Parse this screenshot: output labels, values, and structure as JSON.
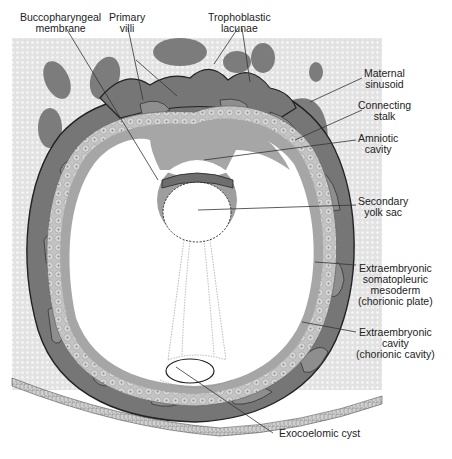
{
  "figure": {
    "colors": {
      "endometrium_fill": "#e4e4e4",
      "endometrium_dots": "#f7f7f7",
      "syncytiotrophoblast": "#7a7a7a",
      "lacuna": "#8c8c8c",
      "cytotrophoblast": "#bdbdbd",
      "mesoderm_band": "#a3a3a3",
      "cavity": "#ffffff",
      "outline": "#2a2a2a",
      "leader_line": "#333333",
      "label_text": "#222222"
    }
  },
  "labels": {
    "buccopharyngeal": {
      "line1": "Buccopharyngeal",
      "line2": "membrane"
    },
    "primary_villi": {
      "line1": "Primary",
      "line2": "villi"
    },
    "trophoblastic_lacunae": {
      "line1": "Trophoblastic",
      "line2": "lacunae"
    },
    "maternal_sinusoid": {
      "line1": "Maternal",
      "line2": "sinusoid"
    },
    "connecting_stalk": {
      "line1": "Connecting",
      "line2": "stalk"
    },
    "amniotic_cavity": {
      "line1": "Amniotic",
      "line2": "cavity"
    },
    "secondary_yolk_sac": {
      "line1": "Secondary",
      "line2": "yolk sac"
    },
    "extraembryonic_mesoderm": {
      "line1": "Extraembryonic",
      "line2": "somatopleuric",
      "line3": "mesoderm",
      "line4": "(chorionic plate)"
    },
    "extraembryonic_cavity": {
      "line1": "Extraembryonic",
      "line2": "cavity",
      "line3": "(chorionic cavity)"
    },
    "exocoelomic_cyst": {
      "line1": "Exocoelomic cyst"
    }
  }
}
